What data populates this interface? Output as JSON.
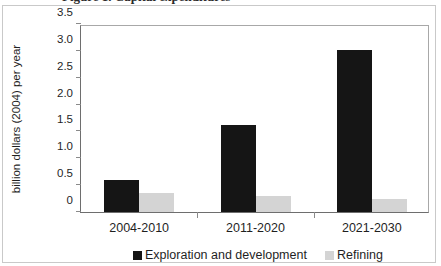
{
  "figure": {
    "clipped_title_fragment": "Figure 1. Capital expenditures"
  },
  "chart_data": {
    "type": "bar",
    "title": "",
    "xlabel": "",
    "ylabel": "billion dollars (2004) per year",
    "categories": [
      "2004-2010",
      "2011-2020",
      "2021-2030"
    ],
    "series": [
      {
        "name": "Exploration and development",
        "color": "#151515",
        "values": [
          0.6,
          1.62,
          3.02
        ]
      },
      {
        "name": "Refining",
        "color": "#d4d4d4",
        "values": [
          0.35,
          0.3,
          0.25
        ]
      }
    ],
    "ylim": [
      0,
      3.5
    ],
    "yticks": [
      0,
      0.5,
      1.0,
      1.5,
      2.0,
      2.5,
      3.0,
      3.5
    ],
    "ytick_labels": [
      "0",
      "0.5",
      "1.0",
      "1.5",
      "2.0",
      "2.5",
      "3.0",
      "3.5"
    ],
    "grid": false,
    "legend_position": "bottom"
  }
}
